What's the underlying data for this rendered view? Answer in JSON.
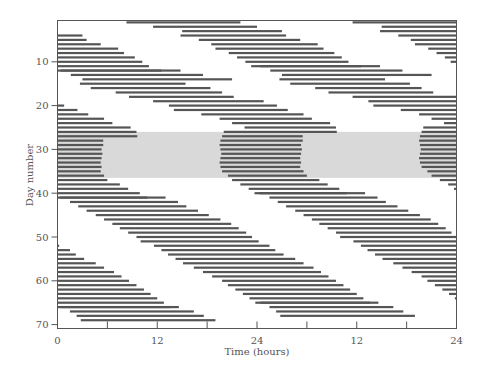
{
  "chart_data": {
    "type": "actogram",
    "title": "",
    "xlabel": "Time (hours)",
    "ylabel": "Day number",
    "double_plotted": true,
    "x_range_hours": [
      0,
      48
    ],
    "x_tick_labels": [
      {
        "hour": 0,
        "label": "0"
      },
      {
        "hour": 12,
        "label": "12"
      },
      {
        "hour": 24,
        "label": "24"
      },
      {
        "hour": 36,
        "label": "12"
      },
      {
        "hour": 48,
        "label": "24"
      }
    ],
    "x_minor_ticks_hours": [
      6,
      18,
      30,
      42
    ],
    "y_range_days": [
      0.5,
      70.5
    ],
    "y_tick_labels": [
      {
        "day": 10,
        "label": "10"
      },
      {
        "day": 20,
        "label": "20"
      },
      {
        "day": 30,
        "label": "30"
      },
      {
        "day": 40,
        "label": "40"
      },
      {
        "day": 50,
        "label": "50"
      },
      {
        "day": 60,
        "label": "60"
      },
      {
        "day": 70,
        "label": "70"
      }
    ],
    "shaded_region": {
      "day_start": 26,
      "day_end": 36.5,
      "color": "#d9d9d9",
      "label": ""
    },
    "bar_color": "#555555",
    "activity_bouts": [
      {
        "day": 1,
        "onset": 8.3,
        "offset": 22.0
      },
      {
        "day": 2,
        "onset": 11.5,
        "offset": 24.0
      },
      {
        "day": 3,
        "onset": 15.0,
        "offset": 27.0
      },
      {
        "day": 4,
        "onset": 14.8,
        "offset": 27.5
      },
      {
        "day": 5,
        "onset": 17.0,
        "offset": 29.2
      },
      {
        "day": 6,
        "onset": 18.5,
        "offset": 31.3
      },
      {
        "day": 7,
        "onset": 19.0,
        "offset": 32.0
      },
      {
        "day": 8,
        "onset": 20.6,
        "offset": 33.3
      },
      {
        "day": 9,
        "onset": 21.6,
        "offset": 34.2
      },
      {
        "day": 10,
        "onset": 22.6,
        "offset": 35.0
      },
      {
        "day": 11,
        "onset": 23.3,
        "offset": 36.5
      },
      {
        "day": 12,
        "onset": 24.4,
        "offset": 38.8
      },
      {
        "day": 13,
        "onset": 25.6,
        "offset": 41.5
      },
      {
        "day": 14,
        "onset": 27.0,
        "offset": 45.0
      },
      {
        "day": 15,
        "onset": 26.7,
        "offset": 39.4
      },
      {
        "day": 16,
        "onset": 28.0,
        "offset": 42.4
      },
      {
        "day": 17,
        "onset": 31.0,
        "offset": 43.8
      },
      {
        "day": 18,
        "onset": 32.6,
        "offset": 45.2
      },
      {
        "day": 19,
        "onset": 35.5,
        "offset": 48.8
      },
      {
        "day": 20,
        "onset": 37.4,
        "offset": 50.4
      },
      {
        "day": 21,
        "onset": 38.0,
        "offset": 51.7
      },
      {
        "day": 22,
        "onset": 41.3,
        "offset": 53.6
      },
      {
        "day": 23,
        "onset": 43.5,
        "offset": 54.6
      },
      {
        "day": 24,
        "onset": 45.0,
        "offset": 56.8
      },
      {
        "day": 25,
        "onset": 46.5,
        "offset": 57.5
      },
      {
        "day": 26,
        "onset": 44.0,
        "offset": 57.6
      },
      {
        "day": 27,
        "onset": 43.8,
        "offset": 53.5
      },
      {
        "day": 28,
        "onset": 43.6,
        "offset": 53.5
      },
      {
        "day": 29,
        "onset": 43.5,
        "offset": 53.3
      },
      {
        "day": 30,
        "onset": 43.6,
        "offset": 53.4
      },
      {
        "day": 31,
        "onset": 43.7,
        "offset": 53.3
      },
      {
        "day": 32,
        "onset": 43.6,
        "offset": 53.2
      },
      {
        "day": 33,
        "onset": 43.5,
        "offset": 53.3
      },
      {
        "day": 34,
        "onset": 43.6,
        "offset": 53.2
      },
      {
        "day": 35,
        "onset": 43.8,
        "offset": 53.6
      },
      {
        "day": 36,
        "onset": 44.5,
        "offset": 54.0
      },
      {
        "day": 37,
        "onset": 45.0,
        "offset": 55.5
      },
      {
        "day": 38,
        "onset": 46.0,
        "offset": 56.5
      },
      {
        "day": 39,
        "onset": 47.0,
        "offset": 57.9
      },
      {
        "day": 40,
        "onset": 47.7,
        "offset": 58.8
      },
      {
        "day": 41,
        "onset": 48.3,
        "offset": 61.0
      },
      {
        "day": 42,
        "onset": 49.5,
        "offset": 62.5
      },
      {
        "day": 43,
        "onset": 50.5,
        "offset": 63.5
      },
      {
        "day": 44,
        "onset": 51.5,
        "offset": 64.9
      },
      {
        "day": 45,
        "onset": 52.6,
        "offset": 66.2
      },
      {
        "day": 46,
        "onset": 53.6,
        "offset": 67.6
      },
      {
        "day": 47,
        "onset": 54.6,
        "offset": 68.9
      },
      {
        "day": 48,
        "onset": 55.5,
        "offset": 69.8
      },
      {
        "day": 49,
        "onset": 56.5,
        "offset": 70.7
      },
      {
        "day": 50,
        "onset": 57.5,
        "offset": 71.4
      },
      {
        "day": 51,
        "onset": 58.0,
        "offset": 72.2
      },
      {
        "day": 52,
        "onset": 59.6,
        "offset": 73.5
      },
      {
        "day": 53,
        "onset": 60.5,
        "offset": 74.2
      },
      {
        "day": 54,
        "onset": 61.3,
        "offset": 75.2
      },
      {
        "day": 55,
        "onset": 62.2,
        "offset": 76.6
      },
      {
        "day": 56,
        "onset": 63.1,
        "offset": 77.6
      },
      {
        "day": 57,
        "onset": 64.4,
        "offset": 78.8
      },
      {
        "day": 58,
        "onset": 65.5,
        "offset": 79.7
      },
      {
        "day": 59,
        "onset": 66.6,
        "offset": 80.6
      },
      {
        "day": 60,
        "onset": 67.8,
        "offset": 81.5
      },
      {
        "day": 61,
        "onset": 68.5,
        "offset": 82.4
      },
      {
        "day": 62,
        "onset": 69.4,
        "offset": 83.2
      },
      {
        "day": 63,
        "onset": 70.3,
        "offset": 84.0
      },
      {
        "day": 64,
        "onset": 71.1,
        "offset": 84.8
      },
      {
        "day": 65,
        "onset": 71.8,
        "offset": 85.6
      },
      {
        "day": 66,
        "onset": 72.4,
        "offset": 86.6
      },
      {
        "day": 67,
        "onset": 73.5,
        "offset": 88.4
      },
      {
        "day": 68,
        "onset": 74.3,
        "offset": 89.6
      },
      {
        "day": 69,
        "onset": 74.8,
        "offset": 91.0
      }
    ]
  }
}
